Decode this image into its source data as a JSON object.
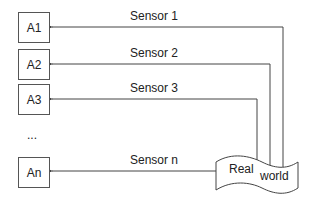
{
  "diagram": {
    "agents": [
      {
        "label": "A1"
      },
      {
        "label": "A2"
      },
      {
        "label": "A3"
      },
      {
        "label": "An"
      }
    ],
    "ellipsis": "...",
    "sensors": [
      {
        "label": "Sensor 1"
      },
      {
        "label": "Sensor 2"
      },
      {
        "label": "Sensor 3"
      },
      {
        "label": "Sensor n"
      }
    ],
    "source": {
      "word1": "Real",
      "word2": "world"
    },
    "colors": {
      "line": "#444444",
      "text": "#222222",
      "background": "#ffffff"
    }
  }
}
